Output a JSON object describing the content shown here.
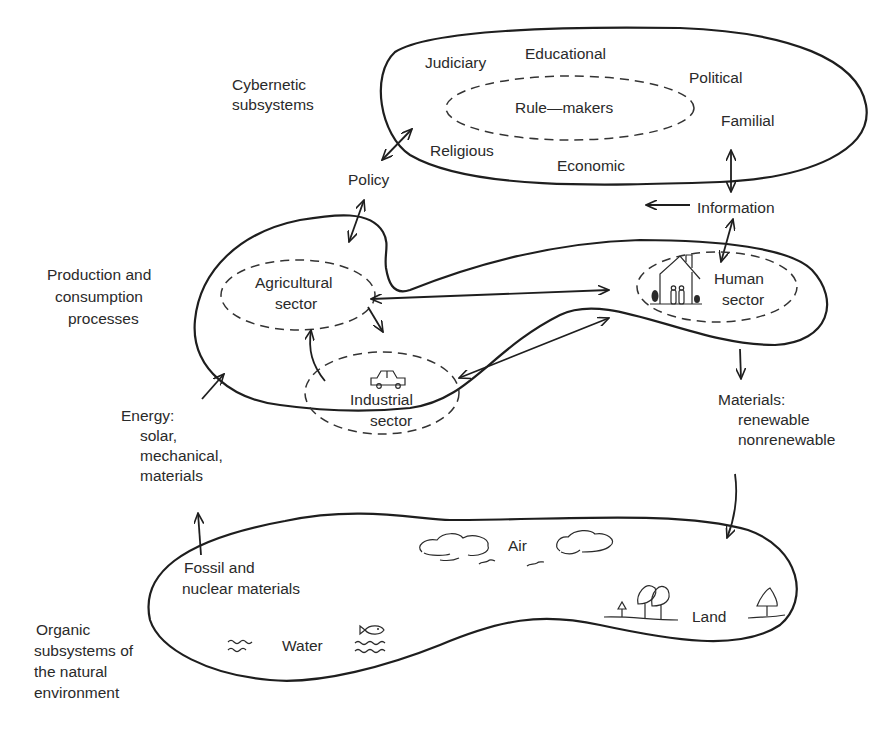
{
  "diagram": {
    "type": "system-flow",
    "colors": {
      "stroke": "#1e1e1e",
      "text": "#2a2a2a",
      "background": "#ffffff"
    },
    "cybernetic": {
      "label_line1": "Cybernetic",
      "label_line2": "subsystems",
      "subsystems": [
        "Judiciary",
        "Educational",
        "Political",
        "Familial",
        "Religious",
        "Economic"
      ],
      "core": "Rule—makers"
    },
    "flows": {
      "policy": "Policy",
      "information": "Information",
      "materials_line1": "Materials:",
      "materials_line2": "renewable",
      "materials_line3": "nonrenewable",
      "energy_line1": "Energy:",
      "energy_line2": "solar,",
      "energy_line3": "mechanical,",
      "energy_line4": "materials",
      "fossil_line1": "Fossil and",
      "fossil_line2": "nuclear materials"
    },
    "production": {
      "label_line1": "Production and",
      "label_line2": "consumption",
      "label_line3": "processes",
      "sectors": {
        "agricultural_line1": "Agricultural",
        "agricultural_line2": "sector",
        "industrial_line1": "Industrial",
        "industrial_line2": "sector",
        "human_line1": "Human",
        "human_line2": "sector"
      },
      "icons": [
        "house-icon",
        "car-icon"
      ]
    },
    "natural": {
      "label_line1": "Organic",
      "label_line2": "subsystems of",
      "label_line3": "the natural",
      "label_line4": "environment",
      "regions": {
        "air": "Air",
        "water": "Water",
        "land": "Land"
      },
      "icons": [
        "cloud-icon",
        "bird-icon",
        "fish-icon",
        "wave-icon",
        "tree-icon"
      ]
    }
  }
}
